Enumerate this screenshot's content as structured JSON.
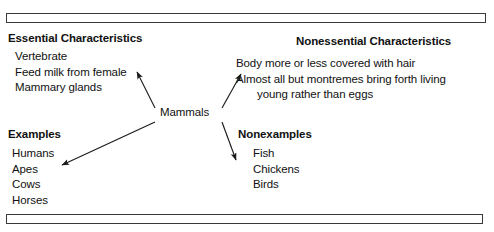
{
  "diagram": {
    "hub": {
      "label": "Mammals"
    },
    "quadrants": {
      "essential": {
        "heading": "Essential Characteristics",
        "items": [
          "Vertebrate",
          "Feed milk from female",
          "Mammary glands"
        ]
      },
      "nonessential": {
        "heading": "Nonessential Characteristics",
        "items": [
          "Body more or less covered with hair",
          "Almost all but montremes bring forth living",
          "young rather than eggs"
        ]
      },
      "examples": {
        "heading": "Examples",
        "items": [
          "Humans",
          "Apes",
          "Cows",
          "Horses"
        ]
      },
      "nonexamples": {
        "heading": "Nonexamples",
        "items": [
          "Fish",
          "Chickens",
          "Birds"
        ]
      }
    },
    "connectors": [
      {
        "name": "arrow-to-essential",
        "from": [
          155,
          108
        ],
        "to": [
          137,
          72
        ]
      },
      {
        "name": "arrow-to-nonessential",
        "from": [
          222,
          108
        ],
        "to": [
          241,
          74
        ]
      },
      {
        "name": "arrow-to-examples",
        "from": [
          155,
          122
        ],
        "to": [
          62,
          165
        ]
      },
      {
        "name": "arrow-to-nonexamples",
        "from": [
          222,
          122
        ],
        "to": [
          236,
          160
        ]
      }
    ],
    "rules": {
      "top_bar": "horizontal-divider-bar",
      "bottom_bar": "horizontal-divider-bar"
    },
    "colors": {
      "ink": "#111111",
      "rule_stroke": "#3a3a3a",
      "background": "#ffffff"
    }
  }
}
